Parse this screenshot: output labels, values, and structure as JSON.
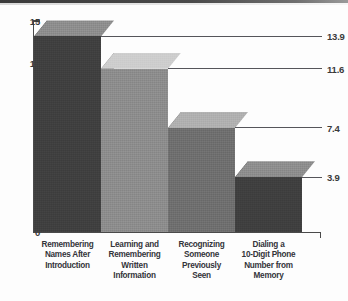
{
  "chart_data": {
    "type": "bar",
    "title": "",
    "subtitle": "",
    "xlabel": "",
    "ylabel": "",
    "ylim": [
      0,
      15
    ],
    "ytick_labels": [
      "0",
      "3",
      "6",
      "9",
      "12",
      "15"
    ],
    "ytick_values": [
      0,
      3,
      6,
      9,
      12,
      15
    ],
    "grid": false,
    "legend": "none",
    "style": "3d-bar-grayscale",
    "categories": [
      "Remembering Names After Introduction",
      "Learning and Remembering Written Information",
      "Recognizing Someone Previously Seen",
      "Dialing a 10-Digit Phone Number from Memory"
    ],
    "category_lines": [
      [
        "Remembering",
        "Names After",
        "Introduction"
      ],
      [
        "Learning and",
        "Remembering",
        "Written",
        "Information"
      ],
      [
        "Recognizing",
        "Someone",
        "Previously",
        "Seen"
      ],
      [
        "Dialing a",
        "10-Digit Phone",
        "Number from",
        "Memory"
      ]
    ],
    "values": [
      13.9,
      11.6,
      7.4,
      3.9
    ],
    "value_labels": [
      "13.9",
      "11.6",
      "7.4",
      "3.9"
    ],
    "bar_colors_front": [
      "#3f3f3f",
      "#8c8c8c",
      "#6e6e6e",
      "#3f3f3f"
    ],
    "bar_colors_top": [
      "#8d8d8d",
      "#cdcdcd",
      "#b0b0b0",
      "#8d8d8d"
    ],
    "bar_colors_side": [
      "#272727",
      "#5f5f5f",
      "#474747",
      "#272727"
    ]
  },
  "axes": {
    "y_axis_color": "#4a4a4a",
    "x_axis_color": "#4a4a4a",
    "leader_line_color": "#55555a",
    "label_color": "#3a3a3a"
  },
  "decor": {
    "top_rule_color": "#3a3a3a"
  }
}
